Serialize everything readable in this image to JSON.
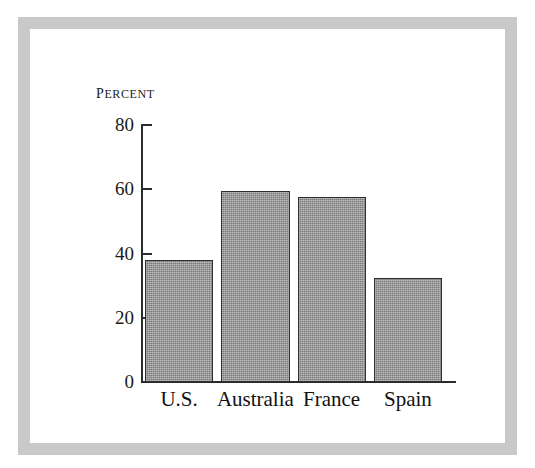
{
  "chart_data": {
    "type": "bar",
    "title": "",
    "subtitle": "",
    "xlabel": "",
    "ylabel": "Percent",
    "categories": [
      "U.S.",
      "Australia",
      "France",
      "Spain"
    ],
    "values": [
      38,
      59.5,
      57.5,
      32.5
    ],
    "ylim": [
      0,
      80
    ],
    "yticks": [
      0,
      20,
      40,
      60,
      80
    ],
    "ytick_labels": [
      "0",
      "20",
      "40",
      "60",
      "80"
    ],
    "grid": false,
    "legend": null,
    "bar_color": "#969696",
    "bar_edge_color": "#2f2f2f",
    "axis_color": "#2b2b2b",
    "frame_color": "#c9c9c9",
    "background_color": "#ffffff"
  }
}
